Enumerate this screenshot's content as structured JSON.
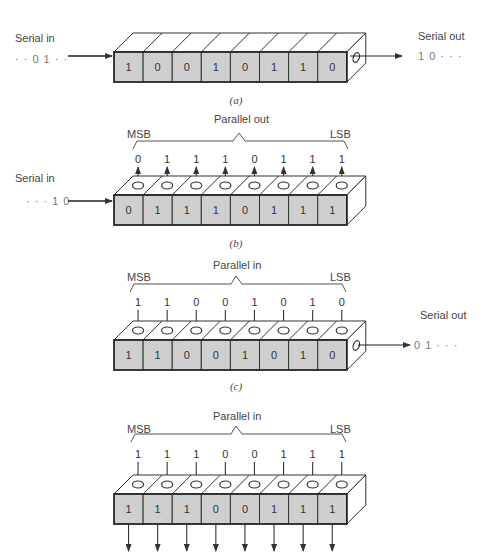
{
  "figure": {
    "colors": {
      "cell_fill": "#cfcfcf",
      "stroke": "#333333",
      "text": "#444444",
      "background": "#ffffff"
    },
    "panels": [
      {
        "id": "a",
        "caption": "(a)",
        "mode": "serial-in serial-out",
        "serial_in_label": "Serial in",
        "serial_in_sequence": "· · 0 1 · ·",
        "serial_out_label": "Serial out",
        "serial_out_sequence": "1 0 · · ·",
        "register_bits": [
          "1",
          "0",
          "0",
          "1",
          "0",
          "1",
          "1",
          "0"
        ]
      },
      {
        "id": "b",
        "caption": "(b)",
        "mode": "serial-in parallel-out",
        "bracket_label": "Parallel out",
        "msb_label": "MSB",
        "lsb_label": "LSB",
        "serial_in_label": "Serial in",
        "serial_in_sequence": "· · · 1 0",
        "parallel_bits": [
          "0",
          "1",
          "1",
          "1",
          "0",
          "1",
          "1",
          "1"
        ],
        "register_bits": [
          "0",
          "1",
          "1",
          "1",
          "0",
          "1",
          "1",
          "1"
        ]
      },
      {
        "id": "c",
        "caption": "(c)",
        "mode": "parallel-in serial-out",
        "bracket_label": "Parallel in",
        "msb_label": "MSB",
        "lsb_label": "LSB",
        "serial_out_label": "Serial out",
        "serial_out_sequence": "0 1 · · ·",
        "parallel_bits": [
          "1",
          "1",
          "0",
          "0",
          "1",
          "0",
          "1",
          "0"
        ],
        "register_bits": [
          "1",
          "1",
          "0",
          "0",
          "1",
          "0",
          "1",
          "0"
        ]
      },
      {
        "id": "d",
        "caption": "(d)",
        "mode": "parallel-in parallel-out",
        "bracket_label": "Parallel in",
        "msb_label": "MSB",
        "lsb_label": "LSB",
        "parallel_bits": [
          "1",
          "1",
          "1",
          "0",
          "0",
          "1",
          "1",
          "1"
        ],
        "register_bits": [
          "1",
          "1",
          "1",
          "0",
          "0",
          "1",
          "1",
          "1"
        ]
      }
    ]
  }
}
